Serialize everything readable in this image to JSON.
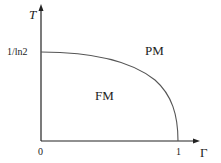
{
  "diagram": {
    "type": "phase_diagram",
    "axes": {
      "y_label": "T",
      "x_label": "Γ",
      "y_ticks": [
        {
          "label": "1/ln2",
          "value": 1.4427
        }
      ],
      "x_ticks": [
        {
          "label": "0",
          "value": 0
        },
        {
          "label": "1",
          "value": 1
        }
      ]
    },
    "regions": [
      {
        "id": "fm",
        "label": "FM"
      },
      {
        "id": "pm",
        "label": "PM"
      }
    ],
    "boundary": {
      "description": "Phase boundary from (0, 1/ln2) curving down to (1, 0)",
      "start": {
        "x": 0,
        "y": "1/ln2"
      },
      "end": {
        "x": 1,
        "y": 0
      }
    },
    "colors": {
      "axis": "#222222",
      "curve": "#555555",
      "text": "#222222",
      "background": "#ffffff"
    }
  }
}
